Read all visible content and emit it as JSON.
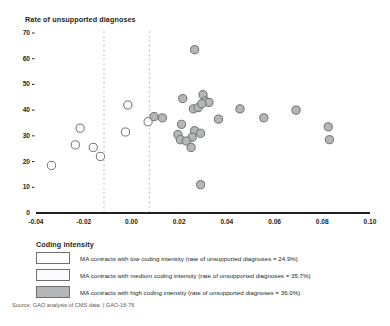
{
  "chart_data": {
    "type": "scatter",
    "title": "",
    "ylabel": "Rate of unsupported diagnoses",
    "xlabel": "",
    "xlim": [
      -0.04,
      0.1
    ],
    "ylim": [
      0,
      70
    ],
    "xticks": [
      "-0.04",
      "-0.02",
      "0.00",
      "0.02",
      "0.04",
      "0.06",
      "0.08",
      "0.10"
    ],
    "xtick_values": [
      -0.04,
      -0.02,
      0.0,
      0.02,
      0.04,
      0.06,
      0.08,
      0.1
    ],
    "yticks": [
      "0",
      "10",
      "20",
      "30",
      "40",
      "50",
      "60",
      "70"
    ],
    "ytick_values": [
      0,
      10,
      20,
      30,
      40,
      50,
      60,
      70
    ],
    "grid": false,
    "legend_position": "below-plot",
    "reference_lines": [
      {
        "name": "low-medium-divider",
        "orientation": "vertical",
        "x": -0.0115,
        "style": "dashed"
      },
      {
        "name": "medium-high-divider",
        "orientation": "vertical",
        "x": 0.0075,
        "style": "dashed"
      }
    ],
    "series": [
      {
        "name": "MA contracts with low coding intensity",
        "marker": "open-circle",
        "fill": "#ffffff",
        "stroke": "#6d6e71",
        "points": [
          {
            "x": -0.0335,
            "y": 18.5
          },
          {
            "x": -0.0215,
            "y": 33.0
          },
          {
            "x": -0.0235,
            "y": 26.5
          },
          {
            "x": -0.016,
            "y": 25.5
          },
          {
            "x": -0.013,
            "y": 22.0
          }
        ]
      },
      {
        "name": "MA contracts with medium coding intensity",
        "marker": "open-circle",
        "fill": "#fbfbfb",
        "stroke": "#6d6e71",
        "points": [
          {
            "x": -0.0015,
            "y": 42.0
          },
          {
            "x": -0.0025,
            "y": 31.5
          },
          {
            "x": 0.007,
            "y": 35.5
          }
        ]
      },
      {
        "name": "MA contracts with high coding intensity",
        "marker": "filled-circle",
        "fill": "#b5b6b8",
        "stroke": "#6d6e71",
        "points": [
          {
            "x": 0.0095,
            "y": 37.5
          },
          {
            "x": 0.013,
            "y": 37.0
          },
          {
            "x": 0.0265,
            "y": 63.5
          },
          {
            "x": 0.0215,
            "y": 44.5
          },
          {
            "x": 0.026,
            "y": 40.5
          },
          {
            "x": 0.028,
            "y": 41.0
          },
          {
            "x": 0.03,
            "y": 46.0
          },
          {
            "x": 0.031,
            "y": 43.5
          },
          {
            "x": 0.0325,
            "y": 43.0
          },
          {
            "x": 0.0295,
            "y": 42.5
          },
          {
            "x": 0.021,
            "y": 34.5
          },
          {
            "x": 0.0265,
            "y": 32.0
          },
          {
            "x": 0.029,
            "y": 31.0
          },
          {
            "x": 0.0255,
            "y": 29.5
          },
          {
            "x": 0.0195,
            "y": 30.5
          },
          {
            "x": 0.0205,
            "y": 28.5
          },
          {
            "x": 0.023,
            "y": 28.0
          },
          {
            "x": 0.025,
            "y": 25.5
          },
          {
            "x": 0.0365,
            "y": 36.5
          },
          {
            "x": 0.029,
            "y": 11.0
          },
          {
            "x": 0.0455,
            "y": 40.5
          },
          {
            "x": 0.0555,
            "y": 37.0
          },
          {
            "x": 0.069,
            "y": 40.0
          },
          {
            "x": 0.0825,
            "y": 33.5
          },
          {
            "x": 0.083,
            "y": 28.5
          }
        ]
      }
    ],
    "legend": [
      {
        "swatch": "low",
        "color": "#ffffff",
        "label": "MA contracts with low coding intensity (rate of unsupported diagnoses = 24.9%)"
      },
      {
        "swatch": "medium",
        "color": "#fbfbfb",
        "label": "MA contracts with medium coding intensity (rate of unsupported diagnoses = 35.7%)"
      },
      {
        "swatch": "high",
        "color": "#b5b6b8",
        "label": "MA contracts with high coding intensity (rate of unsupported diagnoses = 36.0%)"
      }
    ],
    "legend_title": "Coding intensity",
    "source": "Source: GAO analysis of CMS data.  |  GAO-16-76"
  },
  "colors": {
    "axis": "#231f20",
    "marker_stroke": "#6d6e71",
    "marker_high_fill": "#b5b6b8",
    "marker_low_fill": "#ffffff",
    "marker_medium_fill": "#fbfbfb",
    "dashed_line": "#bcbec0",
    "source_text": "#58595b"
  }
}
